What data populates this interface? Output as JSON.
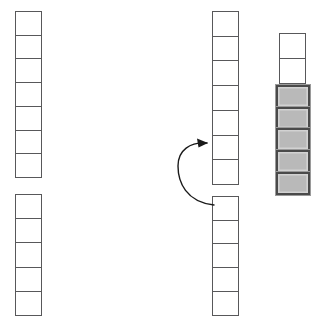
{
  "diagram": {
    "width": 317,
    "height": 331,
    "background_color": "#ffffff",
    "empty_cell": {
      "fill_color": "#ffffff",
      "stroke_color": "#58585a",
      "stroke_width": 1.3
    },
    "filled_cell": {
      "fill_color": "#b9b9b9",
      "frame_color": "#4a4a4a",
      "bevel_color": "#d2d2d2",
      "outline_color": "#9a9a9a",
      "frame_width": 2.6
    },
    "arrow": {
      "color": "#1a1a1a",
      "stroke_width": 1.4,
      "direction": "counterclockwise-up",
      "from_label": "lower-middle-stack",
      "to_label": "upper-middle-stack",
      "path": "M 214 205 C 186 202 178 182 178 166 C 178 150 190 142 207 143",
      "head_points": "208,143 197,138.5 198.5,147.5"
    },
    "stacks": [
      {
        "id": "left-upper-stack",
        "name": "left-upper-stack",
        "x": 15,
        "y": 11,
        "cell_width": 27,
        "cell_height": 25,
        "count": 7,
        "cells": [
          "empty",
          "empty",
          "empty",
          "empty",
          "empty",
          "empty",
          "empty"
        ]
      },
      {
        "id": "left-lower-stack",
        "name": "left-lower-stack",
        "x": 15,
        "y": 194,
        "cell_width": 27,
        "cell_height": 25.5,
        "count": 5,
        "cells": [
          "empty",
          "empty",
          "empty",
          "empty",
          "empty"
        ]
      },
      {
        "id": "middle-upper-stack",
        "name": "middle-upper-stack",
        "x": 212,
        "y": 11,
        "cell_width": 27,
        "cell_height": 26,
        "count": 7,
        "cells": [
          "empty",
          "empty",
          "empty",
          "empty",
          "empty",
          "empty",
          "empty"
        ]
      },
      {
        "id": "middle-lower-stack",
        "name": "middle-lower-stack",
        "x": 212,
        "y": 196,
        "cell_width": 27,
        "cell_height": 25,
        "count": 5,
        "cells": [
          "empty",
          "empty",
          "empty",
          "empty",
          "empty"
        ]
      },
      {
        "id": "right-stack-empty-part",
        "name": "right-stack-empty-part",
        "x": 279,
        "y": 33,
        "cell_width": 27,
        "cell_height": 26,
        "count": 2,
        "cells": [
          "empty",
          "empty"
        ]
      },
      {
        "id": "right-stack-filled-part",
        "name": "right-stack-filled-part",
        "x": 276,
        "y": 85,
        "cell_width": 34,
        "cell_height": 23,
        "count": 5,
        "cells": [
          "filled",
          "filled",
          "filled",
          "filled",
          "filled"
        ]
      }
    ]
  }
}
